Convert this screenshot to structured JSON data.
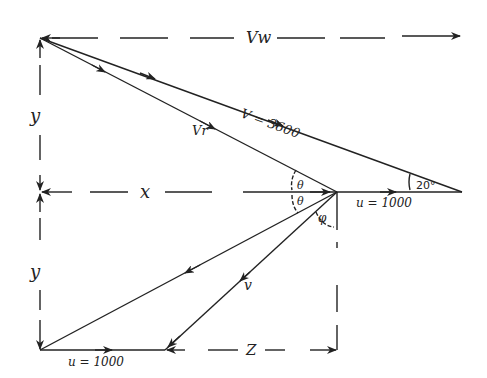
{
  "diagram": {
    "labels": {
      "vw": "Vw",
      "v": "V = 3600",
      "vr": "Vr",
      "y_upper": "y",
      "y_lower": "y",
      "x": "x",
      "theta_upper": "θ",
      "theta_lower": "θ",
      "phi": "φ",
      "angle_20": "20°",
      "u_mid": "u = 1000",
      "u_bottom": "u = 1000",
      "v_lower": "v",
      "z": "Z"
    },
    "values": {
      "V": 3600,
      "u": 1000,
      "angle_deg": 20
    },
    "colors": {
      "ink": "#222222",
      "background": "#ffffff"
    }
  }
}
